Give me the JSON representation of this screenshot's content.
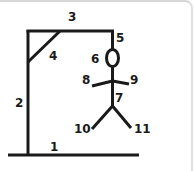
{
  "stroke_color": "#1a1a1a",
  "parts": [
    {
      "id": 1,
      "label": "1",
      "name": "base"
    },
    {
      "id": 2,
      "label": "2",
      "name": "pole"
    },
    {
      "id": 3,
      "label": "3",
      "name": "top-beam"
    },
    {
      "id": 4,
      "label": "4",
      "name": "brace"
    },
    {
      "id": 5,
      "label": "5",
      "name": "rope"
    },
    {
      "id": 6,
      "label": "6",
      "name": "head"
    },
    {
      "id": 7,
      "label": "7",
      "name": "body"
    },
    {
      "id": 8,
      "label": "8",
      "name": "left-arm"
    },
    {
      "id": 9,
      "label": "9",
      "name": "right-arm"
    },
    {
      "id": 10,
      "label": "10",
      "name": "left-leg"
    },
    {
      "id": 11,
      "label": "11",
      "name": "right-leg"
    }
  ]
}
